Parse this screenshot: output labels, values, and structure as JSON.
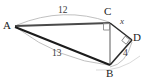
{
  "figure": {
    "width": 147,
    "height": 84,
    "background": "#ffffff",
    "stroke_dark": "#1c1c1c",
    "stroke_mid": "#6e6e6e",
    "stroke_light": "#b9b9b9",
    "vertices": [
      {
        "id": "A",
        "label": "A",
        "x": 15,
        "y": 26,
        "label_x": 3,
        "label_y": 20
      },
      {
        "id": "C",
        "label": "C",
        "x": 110,
        "y": 23,
        "label_x": 104,
        "label_y": 7
      },
      {
        "id": "D",
        "label": "D",
        "x": 132,
        "y": 40,
        "label_x": 133,
        "label_y": 33
      },
      {
        "id": "B",
        "label": "B",
        "x": 110,
        "y": 65,
        "label_x": 106,
        "label_y": 69
      }
    ],
    "segments": [
      {
        "id": "AC",
        "from": "A",
        "to": "C",
        "weight": "dark"
      },
      {
        "id": "AB",
        "from": "A",
        "to": "B",
        "weight": "dark"
      },
      {
        "id": "CB",
        "from": "C",
        "to": "B",
        "weight": "mid"
      },
      {
        "id": "CD",
        "from": "C",
        "to": "D",
        "weight": "dark"
      },
      {
        "id": "DB",
        "from": "D",
        "to": "B",
        "weight": "dark"
      }
    ],
    "arcs": [
      {
        "id": "arc-AC",
        "label_for": "12"
      },
      {
        "id": "arc-AB",
        "label_for": "13"
      },
      {
        "id": "arc-BD",
        "label_for": "4"
      }
    ],
    "length_labels": [
      {
        "id": "len-12",
        "text": "12",
        "x": 58,
        "y": 7
      },
      {
        "id": "len-13",
        "text": "13",
        "x": 52,
        "y": 50
      },
      {
        "id": "len-4",
        "text": "4",
        "x": 123,
        "y": 50
      }
    ],
    "variable_labels": [
      {
        "id": "var-x",
        "text": "x",
        "x": 120,
        "y": 18
      }
    ],
    "right_angles": [
      {
        "id": "right-angle-C",
        "at": "C",
        "type": "square"
      },
      {
        "id": "right-angle-D",
        "at": "D",
        "type": "diamond"
      }
    ]
  }
}
